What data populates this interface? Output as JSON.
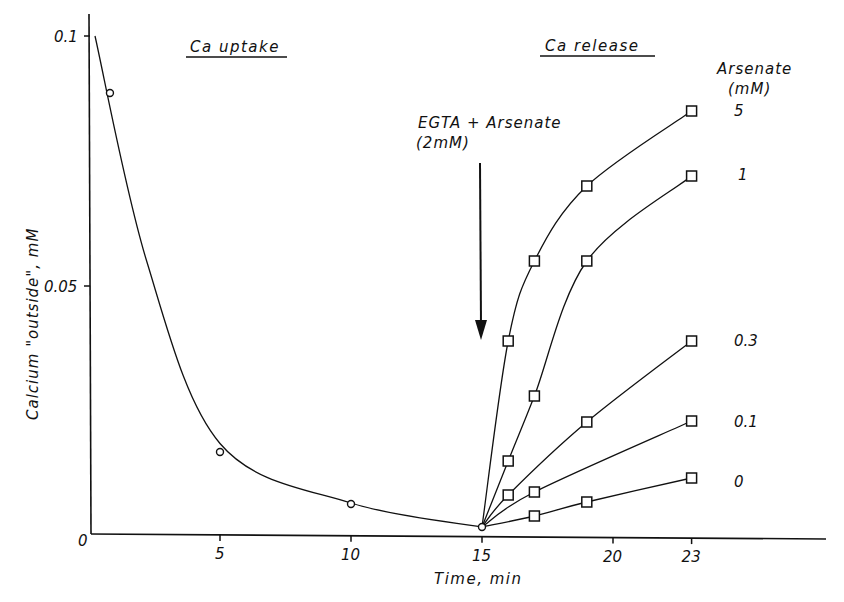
{
  "chart_data": {
    "type": "line",
    "title": "",
    "xlabel": "Time, min",
    "ylabel": "Calcium \"outside\", mM",
    "xlim": [
      0,
      28.5
    ],
    "ylim": [
      0,
      0.1
    ],
    "x_ticks": [
      "0",
      "5",
      "10",
      "15",
      "20",
      "23"
    ],
    "x_tick_values": [
      0,
      5,
      10,
      15,
      20,
      23
    ],
    "y_ticks": [
      "0",
      "0.05",
      "0.1"
    ],
    "y_tick_values": [
      0,
      0.05,
      0.1
    ],
    "grid": false,
    "annotations": {
      "phase_uptake": "Ca uptake",
      "phase_release": "Ca release",
      "arrow_label_line1": "EGTA + Arsenate",
      "arrow_label_line2": "(2mM)",
      "arrow_x": 15,
      "legend_title_line1": "Arsenate",
      "legend_title_line2": "(mM)"
    },
    "series": [
      {
        "name": "Ca uptake",
        "marker": "circle",
        "x": [
          0.8,
          5,
          10,
          15
        ],
        "values": [
          0.0886,
          0.0168,
          0.0064,
          0.0018
        ]
      },
      {
        "name": "5",
        "marker": "square",
        "x": [
          15,
          16,
          17,
          19,
          23
        ],
        "values": [
          0.0018,
          0.039,
          0.055,
          0.07,
          0.085
        ]
      },
      {
        "name": "1",
        "marker": "square",
        "x": [
          15,
          16,
          17,
          19,
          23
        ],
        "values": [
          0.0018,
          0.015,
          0.028,
          0.055,
          0.072
        ]
      },
      {
        "name": "0.3",
        "marker": "square",
        "x": [
          15,
          16,
          19,
          23
        ],
        "values": [
          0.0018,
          0.0082,
          0.0228,
          0.039
        ]
      },
      {
        "name": "0.1",
        "marker": "square",
        "x": [
          15,
          17,
          23
        ],
        "values": [
          0.0018,
          0.0088,
          0.023
        ]
      },
      {
        "name": "0",
        "marker": "square",
        "x": [
          15,
          17,
          19,
          23
        ],
        "values": [
          0.0018,
          0.004,
          0.0068,
          0.0116
        ]
      }
    ]
  }
}
